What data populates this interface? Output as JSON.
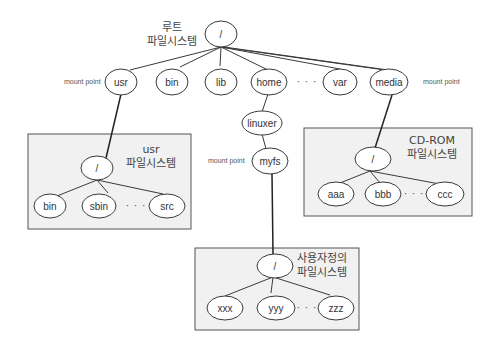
{
  "diagram": {
    "root_fs": {
      "label_line1": "루트",
      "label_line2": "파일시스템",
      "root": "/",
      "children": [
        "usr",
        "bin",
        "lib",
        "home",
        "var",
        "media"
      ],
      "ellipsis": "· · ·",
      "home_child": "linuxer",
      "linuxer_child": "myfs"
    },
    "mount_points": {
      "usr": "mount point",
      "myfs": "mount point",
      "media": "mount point"
    },
    "usr_fs": {
      "label_line1": "usr",
      "label_line2": "파일시스템",
      "root": "/",
      "children": [
        "bin",
        "sbin",
        "src"
      ],
      "ellipsis": "· · ·"
    },
    "cdrom_fs": {
      "label_line1": "CD-ROM",
      "label_line2": "파일시스템",
      "root": "/",
      "children": [
        "aaa",
        "bbb",
        "ccc"
      ],
      "ellipsis": "· · ·"
    },
    "user_fs": {
      "label_line1": "사용자정의",
      "label_line2": "파일시스템",
      "root": "/",
      "children": [
        "xxx",
        "yyy",
        "zzz"
      ],
      "ellipsis": "· · ·"
    }
  }
}
